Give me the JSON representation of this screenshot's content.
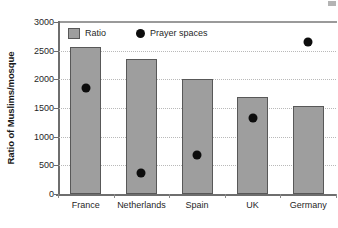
{
  "chart_data": {
    "type": "bar",
    "title": "",
    "xlabel": "",
    "ylabel": "Ratio of Muslims/mosque",
    "ylim": [
      0,
      3000
    ],
    "ytick_step": 500,
    "yticks": [
      "3000",
      "2500",
      "2000",
      "1500",
      "1000",
      "500",
      "0"
    ],
    "grid": true,
    "legend_position": "top-left inside plot",
    "categories": [
      "France",
      "Netherlands",
      "Spain",
      "UK",
      "Germany"
    ],
    "series": [
      {
        "name": "Ratio",
        "marker": "bar",
        "color": "#9e9e9e",
        "values": [
          2570,
          2360,
          2000,
          1700,
          1535
        ]
      },
      {
        "name": "Prayer spaces",
        "marker": "dot",
        "color": "#0d0d0d",
        "values": [
          1850,
          370,
          680,
          1330,
          2650
        ]
      }
    ]
  },
  "legend": {
    "ratio_label": "Ratio",
    "prayer_spaces_label": "Prayer spaces"
  }
}
